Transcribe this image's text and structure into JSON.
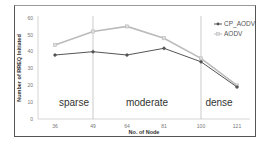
{
  "chart_data": {
    "type": "line",
    "title": "",
    "xlabel": "No. of Node",
    "ylabel": "Number of RREQ Initiated",
    "categories": [
      "36",
      "49",
      "64",
      "81",
      "100",
      "121"
    ],
    "series": [
      {
        "name": "CP_AODV",
        "values": [
          38,
          40,
          38,
          42,
          34,
          19
        ],
        "color": "#555555",
        "marker": "star"
      },
      {
        "name": "AODV",
        "values": [
          44,
          52,
          55,
          48,
          36,
          20
        ],
        "color": "#bbbbbb",
        "marker": "square"
      }
    ],
    "ylim": [
      0,
      60
    ],
    "yticks": [
      "0",
      "10",
      "20",
      "30",
      "40",
      "50",
      "60"
    ],
    "grid": false,
    "legend_position": "top-right",
    "annotations": [
      {
        "text": "sparse",
        "x_range": [
          "36",
          "49"
        ]
      },
      {
        "text": "moderate",
        "x_range": [
          "49",
          "100"
        ]
      },
      {
        "text": "dense",
        "x_range": [
          "100",
          "121"
        ]
      }
    ],
    "separators_at": [
      "49",
      "100"
    ]
  }
}
